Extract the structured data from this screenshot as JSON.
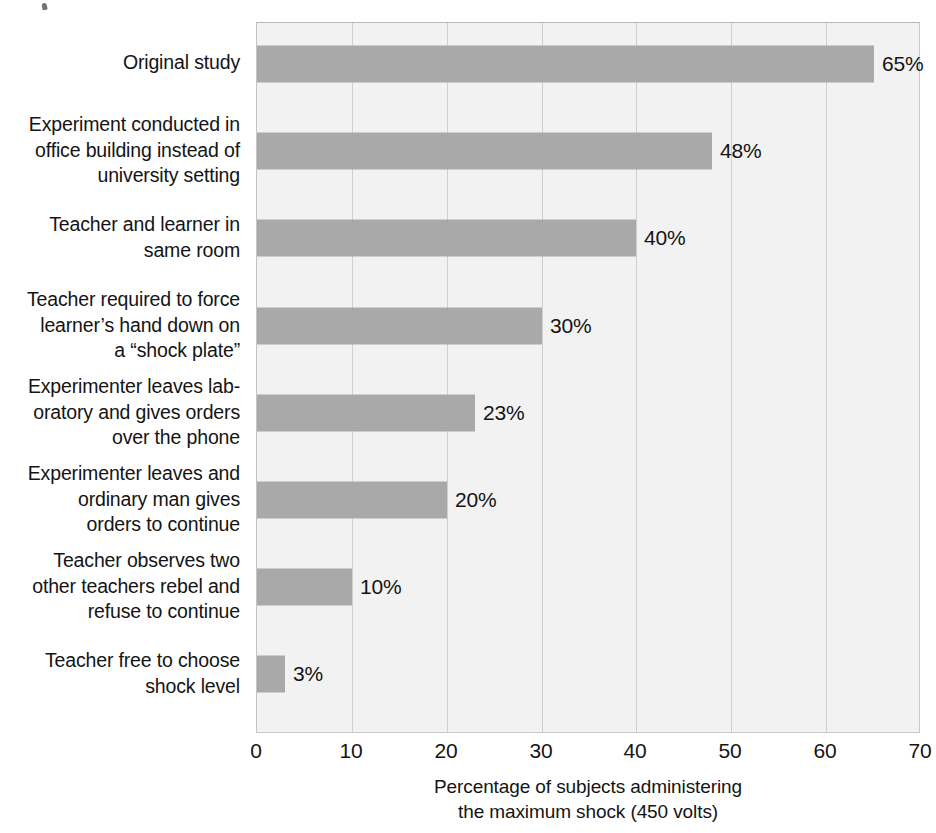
{
  "chart_data": {
    "type": "bar",
    "orientation": "horizontal",
    "title": "",
    "xlabel": "Percentage of subjects administering the maximum shock (450 volts)",
    "xlabel_lines": [
      "Percentage of subjects administering",
      "the maximum shock (450 volts)"
    ],
    "ylabel": "",
    "xlim": [
      0,
      70
    ],
    "xticks": [
      0,
      10,
      20,
      30,
      40,
      50,
      60,
      70
    ],
    "xtick_labels": [
      "0",
      "10",
      "20",
      "30",
      "40",
      "50",
      "60",
      "70"
    ],
    "grid": "vertical",
    "legend": "none",
    "bar_color": "#a9a9a9",
    "plot_background": "#f2f2f2",
    "gridline_color": "#cfcfcf",
    "categories": [
      "Original study",
      "Experiment conducted in office building instead of university setting",
      "Teacher and learner in same room",
      "Teacher required to force learner’s hand down on a “shock plate”",
      "Experimenter leaves laboratory and gives orders over the phone",
      "Experimenter leaves and ordinary man gives orders to continue",
      "Teacher observes two other teachers rebel and refuse to continue",
      "Teacher free to choose shock level"
    ],
    "category_lines": [
      [
        "Original study"
      ],
      [
        "Experiment conducted in",
        "office building instead of",
        "university setting"
      ],
      [
        "Teacher and learner in",
        "same room"
      ],
      [
        "Teacher required to force",
        "learner’s hand down on",
        "a “shock plate”"
      ],
      [
        "Experimenter leaves lab-",
        "oratory and gives orders",
        "over the phone"
      ],
      [
        "Experimenter leaves and",
        "ordinary man gives",
        "orders to continue"
      ],
      [
        "Teacher observes two",
        "other teachers rebel and",
        "refuse to continue"
      ],
      [
        "Teacher free to choose",
        "shock level"
      ]
    ],
    "values": [
      65,
      48,
      40,
      30,
      23,
      20,
      10,
      3
    ],
    "value_labels": [
      "65%",
      "48%",
      "40%",
      "30%",
      "23%",
      "20%",
      "10%",
      "3%"
    ]
  }
}
